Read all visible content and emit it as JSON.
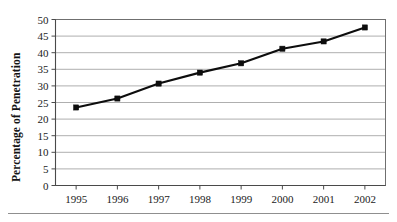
{
  "chart_data": {
    "type": "line",
    "title": "",
    "xlabel": "",
    "ylabel": "Percentage of Penetration",
    "categories": [
      "1995",
      "1996",
      "1997",
      "1998",
      "1999",
      "2000",
      "2001",
      "2002"
    ],
    "x": [
      1995,
      1996,
      1997,
      1998,
      1999,
      2000,
      2001,
      2002
    ],
    "values": [
      23.5,
      26.2,
      30.7,
      34.0,
      36.8,
      41.2,
      43.4,
      47.6
    ],
    "series": [
      {
        "name": "Percentage of Penetration",
        "values": [
          23.5,
          26.2,
          30.7,
          34.0,
          36.8,
          41.2,
          43.4,
          47.6
        ]
      }
    ],
    "ylim": [
      0,
      50
    ],
    "yticks": [
      0,
      5,
      10,
      15,
      20,
      25,
      30,
      35,
      40,
      45,
      50
    ],
    "ytick_labels": [
      "0",
      "5",
      "10",
      "15",
      "20",
      "25",
      "30",
      "35",
      "40",
      "45",
      "50"
    ],
    "xticks": [
      1995,
      1996,
      1997,
      1998,
      1999,
      2000,
      2001,
      2002
    ],
    "xtick_labels": [
      "1995",
      "1996",
      "1997",
      "1998",
      "1999",
      "2000",
      "2001",
      "2002"
    ],
    "grid": "horizontal",
    "legend": "none",
    "marker": "filled-square",
    "line_color": "#0d0d0d",
    "grid_color": "#9a9a9a",
    "background_color": "#ffffff"
  },
  "figure": {
    "has_bottom_rule": true,
    "frame": "plot-border"
  }
}
